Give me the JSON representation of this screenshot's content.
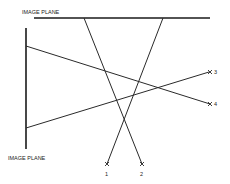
{
  "diagram": {
    "planes": [
      {
        "id": "top",
        "label": "IMAGE PLANE",
        "orientation": "horizontal"
      },
      {
        "id": "left",
        "label": "IMAGE PLANE",
        "orientation": "vertical"
      }
    ],
    "points": [
      {
        "id": "1",
        "label": "1"
      },
      {
        "id": "2",
        "label": "2"
      },
      {
        "id": "3",
        "label": "3"
      },
      {
        "id": "4",
        "label": "4"
      }
    ],
    "rays": [
      {
        "from_plane": "top",
        "to_point": "1"
      },
      {
        "from_plane": "top",
        "to_point": "2"
      },
      {
        "from_plane": "left",
        "to_point": "3"
      },
      {
        "from_plane": "left",
        "to_point": "4"
      }
    ],
    "colors": {
      "ink": "#2a2a2a",
      "background": "#ffffff"
    }
  }
}
